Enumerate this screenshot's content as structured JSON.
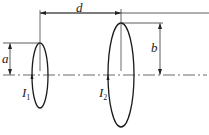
{
  "diagram": {
    "type": "two coaxial current loops with dimensions",
    "labels": {
      "d": "d",
      "a": "a",
      "b": "b",
      "I1_main": "I",
      "I1_sub": "1",
      "I2_main": "I",
      "I2_sub": "2"
    },
    "loops": [
      {
        "name": "loop-1",
        "radius_label": "a",
        "current_label": "I1",
        "center": [
          40,
          75
        ],
        "rx": 8,
        "ry": 33
      },
      {
        "name": "loop-2",
        "radius_label": "b",
        "current_label": "I2",
        "center": [
          121,
          75
        ],
        "rx": 13,
        "ry": 52
      }
    ],
    "separation_label": "d",
    "colors": {
      "stroke": "#1a1a1a",
      "dim": "#333333",
      "background": "#ffffff"
    }
  }
}
